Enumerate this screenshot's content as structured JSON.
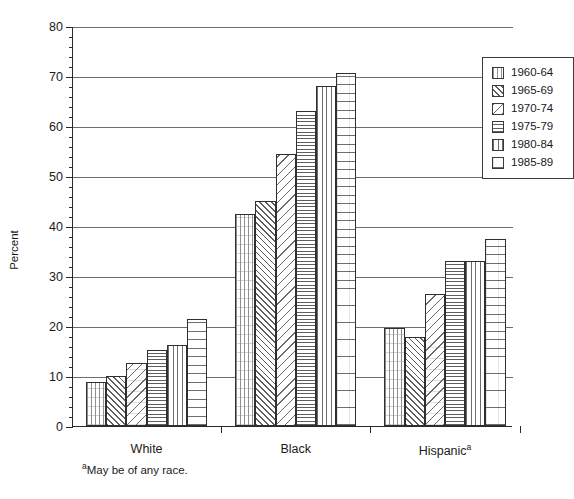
{
  "chart_data": {
    "type": "bar",
    "title": "",
    "xlabel": "",
    "ylabel": "Percent",
    "ylim": [
      0,
      80
    ],
    "ytick_major_step": 10,
    "ytick_minor_step": 2,
    "yticks": [
      0,
      10,
      20,
      30,
      40,
      50,
      60,
      70,
      80
    ],
    "grid": "horizontal major gridlines only",
    "legend_position": "top-right inside plot",
    "categories": [
      "White",
      "Black",
      "Hispanic"
    ],
    "category_labels_display": [
      "White",
      "Black",
      "Hispanicᵃ"
    ],
    "series": [
      {
        "name": "1960-64",
        "values": [
          8.8,
          42.5,
          19.7
        ]
      },
      {
        "name": "1965-69",
        "values": [
          10.0,
          45.0,
          17.8
        ]
      },
      {
        "name": "1970-74",
        "values": [
          12.7,
          54.5,
          26.5
        ]
      },
      {
        "name": "1975-79",
        "values": [
          15.2,
          63.0,
          33.1
        ]
      },
      {
        "name": "1980-84",
        "values": [
          16.2,
          68.0,
          33.1
        ]
      },
      {
        "name": "1985-89",
        "values": [
          21.5,
          70.7,
          37.5
        ]
      }
    ],
    "footnote_marker": "a",
    "footnote": "May be of any race."
  },
  "axes": {
    "y_title": "Percent",
    "y_tick_labels": [
      "0",
      "10",
      "20",
      "30",
      "40",
      "50",
      "60",
      "70",
      "80"
    ],
    "x_group_labels": [
      "White",
      "Black",
      "Hispanic"
    ],
    "hispanic_superscript": "a"
  },
  "legend": {
    "items": [
      {
        "label": "1960-64",
        "pattern": "vertical-dotted-light"
      },
      {
        "label": "1965-69",
        "pattern": "diagonal-up-dense"
      },
      {
        "label": "1970-74",
        "pattern": "diagonal-down-sparse"
      },
      {
        "label": "1975-79",
        "pattern": "horizontal-dense"
      },
      {
        "label": "1980-84",
        "pattern": "vertical-lines"
      },
      {
        "label": "1985-89",
        "pattern": "horizontal-sparse-dotted"
      }
    ]
  },
  "footnote": {
    "marker": "a",
    "text": "May be of any race."
  },
  "colors": {
    "background": "#ffffff",
    "axis": "#2a2a2a",
    "gridline": "#6d6d6d",
    "bar_outline": "#2f2f2f",
    "text": "#1a1a1a"
  }
}
